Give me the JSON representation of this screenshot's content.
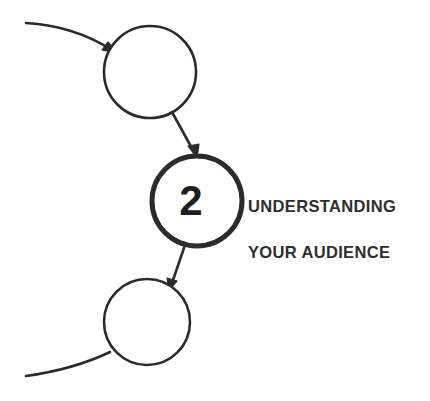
{
  "diagram": {
    "type": "flowchart-step-sequence",
    "background_color": "#ffffff",
    "stroke_color": "#2b2b2b",
    "text_color": "#2e2e2e",
    "active_step": {
      "number": "2",
      "title_line_1": "UNDERSTANDING",
      "title_line_2": "YOUR AUDIENCE",
      "circle": {
        "cx": 197,
        "cy": 201,
        "r": 45,
        "stroke_width": 5,
        "fill": "#ffffff"
      }
    },
    "nodes": [
      {
        "name": "previous-step-circle",
        "label": "",
        "cx": 150,
        "cy": 72,
        "r": 46,
        "stroke_width": 2.6,
        "fill": "#ffffff"
      },
      {
        "name": "current-step-circle",
        "label": "2",
        "cx": 197,
        "cy": 201,
        "r": 45,
        "stroke_width": 5,
        "fill": "#ffffff"
      },
      {
        "name": "next-step-circle",
        "label": "",
        "cx": 147,
        "cy": 322,
        "r": 43,
        "stroke_width": 2.6,
        "fill": "#ffffff"
      }
    ],
    "connectors": [
      {
        "name": "incoming-curve-top-left",
        "kind": "curve",
        "arrowhead": true,
        "from": "left-edge",
        "to": "previous-step-circle"
      },
      {
        "name": "connector-previous-to-current",
        "kind": "line",
        "arrowhead": true,
        "from": "previous-step-circle",
        "to": "current-step-circle"
      },
      {
        "name": "connector-current-to-next",
        "kind": "line",
        "arrowhead": true,
        "from": "current-step-circle",
        "to": "next-step-circle"
      },
      {
        "name": "outgoing-curve-bottom-left",
        "kind": "curve",
        "arrowhead": false,
        "from": "next-step-circle",
        "to": "left-edge"
      }
    ]
  }
}
